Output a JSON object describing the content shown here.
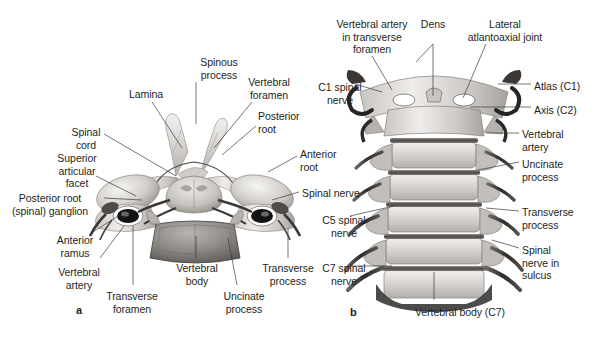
{
  "figure": {
    "background": "#ffffff",
    "ink": "#231f20",
    "leader_color": "#3b3b3b"
  },
  "panels": [
    {
      "letter": "a",
      "x": 76,
      "y": 304,
      "view": "superior view of a cervical vertebra with spinal cord and nerve roots"
    },
    {
      "letter": "b",
      "x": 350,
      "y": 306,
      "view": "anterior view of the cervical spine (C1-C7)"
    }
  ],
  "panel_a": {
    "labels": [
      {
        "id": "spinous-process",
        "text": "Spinous\nprocess",
        "x": 188,
        "y": 56,
        "align": "ctr",
        "w": 62
      },
      {
        "id": "vertebral-foramen",
        "text": "Vertebral\nforamen",
        "x": 238,
        "y": 76,
        "align": "ctr",
        "w": 62
      },
      {
        "id": "lamina",
        "text": "Lamina",
        "x": 122,
        "y": 88,
        "align": "ctr",
        "w": 48
      },
      {
        "id": "posterior-root",
        "text": "Posterior\nroot",
        "x": 258,
        "y": 110,
        "align": "lt",
        "w": 62
      },
      {
        "id": "spinal-cord",
        "text": "Spinal\ncord",
        "x": 62,
        "y": 126,
        "align": "ctr",
        "w": 48
      },
      {
        "id": "anterior-root",
        "text": "Anterior\nroot",
        "x": 300,
        "y": 148,
        "align": "lt",
        "w": 62
      },
      {
        "id": "superior-articular-facet",
        "text": "Superior\narticular\nfacet",
        "x": 46,
        "y": 152,
        "align": "ctr",
        "w": 62
      },
      {
        "id": "spinal-nerve",
        "text": "Spinal nerve",
        "x": 302,
        "y": 187,
        "align": "lt",
        "w": 76
      },
      {
        "id": "posterior-root-ganglion",
        "text": "Posterior root\n(spinal) ganglion",
        "x": 2,
        "y": 192,
        "align": "ctr",
        "w": 96
      },
      {
        "id": "anterior-ramus",
        "text": "Anterior\nramus",
        "x": 46,
        "y": 234,
        "align": "ctr",
        "w": 58
      },
      {
        "id": "vertebral-artery",
        "text": "Vertebral\nartery",
        "x": 50,
        "y": 266,
        "align": "ctr",
        "w": 58
      },
      {
        "id": "transverse-foramen",
        "text": "Transverse\nforamen",
        "x": 98,
        "y": 290,
        "align": "ctr",
        "w": 68
      },
      {
        "id": "vertebral-body",
        "text": "Vertebral\nbody",
        "x": 166,
        "y": 262,
        "align": "ctr",
        "w": 62
      },
      {
        "id": "uncinate-process",
        "text": "Uncinate\nprocess",
        "x": 213,
        "y": 290,
        "align": "ctr",
        "w": 62
      },
      {
        "id": "transverse-process",
        "text": "Transverse\nprocess",
        "x": 254,
        "y": 262,
        "align": "ctr",
        "w": 68
      }
    ]
  },
  "panel_b": {
    "labels": [
      {
        "id": "vertebral-artery-in-transverse-foramen",
        "text": "Vertebral artery\nin transverse\nforamen",
        "x": 320,
        "y": 18,
        "align": "ctr",
        "w": 104
      },
      {
        "id": "dens",
        "text": "Dens",
        "x": 414,
        "y": 18,
        "align": "ctr",
        "w": 38
      },
      {
        "id": "lateral-atlantoaxial-joint",
        "text": "Lateral\natlantoaxial joint",
        "x": 456,
        "y": 18,
        "align": "ctr",
        "w": 98
      },
      {
        "id": "c1-spinal-nerve",
        "text": "C1 spinal\nnerve",
        "x": 310,
        "y": 81,
        "align": "ctr",
        "w": 60
      },
      {
        "id": "atlas-c1",
        "text": "Atlas (C1)",
        "x": 534,
        "y": 80,
        "align": "lt",
        "w": 62
      },
      {
        "id": "axis-c2",
        "text": "Axis (C2)",
        "x": 534,
        "y": 104,
        "align": "lt",
        "w": 58
      },
      {
        "id": "vertebral-artery-b",
        "text": "Vertebral\nartery",
        "x": 522,
        "y": 128,
        "align": "lt",
        "w": 62
      },
      {
        "id": "uncinate-process-b",
        "text": "Uncinate\nprocess",
        "x": 522,
        "y": 158,
        "align": "lt",
        "w": 62
      },
      {
        "id": "transverse-process-b",
        "text": "Transverse\nprocess",
        "x": 522,
        "y": 206,
        "align": "lt",
        "w": 72
      },
      {
        "id": "spinal-nerve-in-sulcus",
        "text": "Spinal\nnerve in\nsulcus",
        "x": 522,
        "y": 244,
        "align": "lt",
        "w": 58
      },
      {
        "id": "c5-spinal-nerve",
        "text": "C5 spinal\nnerve",
        "x": 314,
        "y": 214,
        "align": "ctr",
        "w": 60
      },
      {
        "id": "c7-spinal-nerve",
        "text": "C7 spinal\nnerve",
        "x": 314,
        "y": 262,
        "align": "ctr",
        "w": 60
      },
      {
        "id": "vertebral-body-c7",
        "text": "Vertebral body (C7)",
        "x": 398,
        "y": 306,
        "align": "ctr",
        "w": 124
      }
    ]
  },
  "leader_lines": {
    "panel_a": [
      {
        "id": "lead-spinous-process",
        "pts": "196,82 196,124"
      },
      {
        "id": "lead-vertebral-foramen",
        "pts": "252,102 214,148"
      },
      {
        "id": "lead-lamina",
        "pts": "152,102 182,148"
      },
      {
        "id": "lead-posterior-root",
        "pts": "256,126 222,155"
      },
      {
        "id": "lead-spinal-cord",
        "pts": "104,134 176,176"
      },
      {
        "id": "lead-anterior-root",
        "pts": "297,156 268,172"
      },
      {
        "id": "lead-superior-facet",
        "pts": "96,176 136,196"
      },
      {
        "id": "lead-spinal-nerve",
        "pts": "299,192 272,200"
      },
      {
        "id": "lead-pr-ganglion",
        "pts": "104,198 142,200"
      },
      {
        "id": "lead-anterior-ramus",
        "pts": "93,232 118,216"
      },
      {
        "id": "lead-vertebral-artery",
        "pts": "100,258 124,226"
      },
      {
        "id": "lead-transverse-foramen",
        "pts": "133,285 133,226"
      },
      {
        "id": "lead-vertebral-body",
        "pts": "196,258 196,236"
      },
      {
        "id": "lead-uncinate-process",
        "pts": "237,285 228,238"
      },
      {
        "id": "lead-transverse-process",
        "pts": "288,258 288,228"
      }
    ],
    "panel_b": [
      {
        "id": "lead-va-transverse-foramen",
        "pts": "372,56 392,90"
      },
      {
        "id": "lead-dens",
        "pts": "433,44 433,96"
      },
      {
        "id": "lead-dens-2",
        "pts": "433,44 416,62"
      },
      {
        "id": "lead-lateral-joint",
        "pts": "486,44 463,98"
      },
      {
        "id": "lead-c1-nerve",
        "pts": "355,84 382,92"
      },
      {
        "id": "lead-atlas",
        "pts": "531,84 498,84"
      },
      {
        "id": "lead-axis",
        "pts": "531,107 470,107"
      },
      {
        "id": "lead-vertebral-artery-b",
        "pts": "519,133 486,133"
      },
      {
        "id": "lead-uncinate-b",
        "pts": "519,162 478,170"
      },
      {
        "id": "lead-transverse-b",
        "pts": "519,211 486,208"
      },
      {
        "id": "lead-sulcus",
        "pts": "519,248 492,240"
      },
      {
        "id": "lead-c5-nerve",
        "pts": "350,216 394,206"
      },
      {
        "id": "lead-c7-nerve",
        "pts": "350,266 392,266"
      },
      {
        "id": "lead-vertebral-body-c7",
        "pts": "434,300 434,272"
      }
    ]
  }
}
